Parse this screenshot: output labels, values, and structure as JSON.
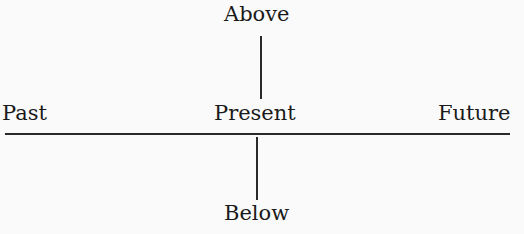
{
  "diagram": {
    "labels": {
      "above": "Above",
      "below": "Below",
      "past": "Past",
      "present": "Present",
      "future": "Future"
    }
  }
}
